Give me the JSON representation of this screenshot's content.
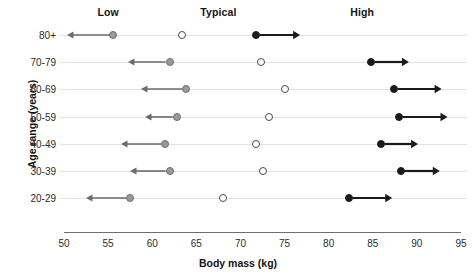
{
  "chart_data": {
    "type": "scatter",
    "title": "",
    "xlabel": "Body mass (kg)",
    "ylabel": "Age range (years)",
    "xlim": [
      50,
      95
    ],
    "xticks": [
      50,
      55,
      60,
      65,
      70,
      75,
      80,
      85,
      90,
      95
    ],
    "xtick_labels": [
      "50",
      "55",
      "60",
      "65",
      "70",
      "75",
      "80",
      "85",
      "90",
      "95"
    ],
    "grid": false,
    "legend_position": "top",
    "band_headers": [
      {
        "label": "Low",
        "x": 55.0
      },
      {
        "label": "Typical",
        "x": 67.5
      },
      {
        "label": "High",
        "x": 83.8
      }
    ],
    "categories": [
      "80+",
      "70-79",
      "60-69",
      "50-59",
      "40-49",
      "30-39",
      "20-29"
    ],
    "series": [
      {
        "name": "Low",
        "marker": "filled-gray-circle",
        "color": "#9a9a9a",
        "arrow_direction": "left",
        "values": [
          55.6,
          62.0,
          63.8,
          62.8,
          61.5,
          62.0,
          57.5
        ],
        "arrow_ends": [
          50.3,
          57.3,
          58.7,
          59.2,
          56.5,
          57.5,
          52.5
        ]
      },
      {
        "name": "Typical",
        "marker": "open-circle",
        "color": "#4a4a4a",
        "arrow_direction": "none",
        "values": [
          63.4,
          72.3,
          75.1,
          73.2,
          71.8,
          72.6,
          68.0
        ],
        "arrow_ends": [
          63.4,
          72.3,
          75.1,
          73.2,
          71.8,
          72.6,
          68.0
        ]
      },
      {
        "name": "High",
        "marker": "filled-black-circle",
        "color": "#1b1b1b",
        "arrow_direction": "right",
        "values": [
          71.8,
          84.8,
          87.4,
          88.0,
          85.9,
          88.2,
          82.3
        ],
        "arrow_ends": [
          76.8,
          89.1,
          92.8,
          93.5,
          90.1,
          92.6,
          87.2
        ]
      }
    ]
  }
}
